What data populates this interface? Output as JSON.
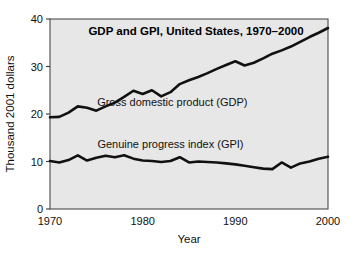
{
  "chart_data": {
    "type": "line",
    "title": "GDP and GPI, United States, 1970–2000",
    "xlabel": "Year",
    "ylabel": "Thousand 2001 dollars",
    "xlim": [
      1970,
      2000
    ],
    "ylim": [
      0,
      40
    ],
    "xticks": [
      "1970",
      "1980",
      "1990",
      "2000"
    ],
    "xtick_values": [
      1970,
      1980,
      1990,
      2000
    ],
    "yticks": [
      "0",
      "10",
      "20",
      "30",
      "40"
    ],
    "ytick_values": [
      0,
      10,
      20,
      30,
      40
    ],
    "grid": false,
    "legend_position": "inline-annotations",
    "plot_background": "#e7e7e7",
    "line_color": "#111111",
    "x": [
      1970,
      1971,
      1972,
      1973,
      1974,
      1975,
      1976,
      1977,
      1978,
      1979,
      1980,
      1981,
      1982,
      1983,
      1984,
      1985,
      1986,
      1987,
      1988,
      1989,
      1990,
      1991,
      1992,
      1993,
      1994,
      1995,
      1996,
      1997,
      1998,
      1999,
      2000
    ],
    "series": [
      {
        "name": "Gross domestic product (GDP)",
        "label": "Gross domestic product (GDP)",
        "label_x": 1983.2,
        "label_y": 21.6,
        "values": [
          19.3,
          19.4,
          20.3,
          21.6,
          21.3,
          20.7,
          21.6,
          22.4,
          23.6,
          24.9,
          24.2,
          25.0,
          23.7,
          24.6,
          26.3,
          27.1,
          27.8,
          28.6,
          29.5,
          30.3,
          31.1,
          30.2,
          30.8,
          31.7,
          32.7,
          33.4,
          34.2,
          35.2,
          36.2,
          37.1,
          38.1
        ]
      },
      {
        "name": "Genuine progress index (GPI)",
        "label": "Genuine progress index (GPI)",
        "label_x": 1983.0,
        "label_y": 12.8,
        "values": [
          10.1,
          9.8,
          10.3,
          11.3,
          10.2,
          10.8,
          11.2,
          10.9,
          11.3,
          10.6,
          10.2,
          10.1,
          9.9,
          10.1,
          10.9,
          9.8,
          10.0,
          9.9,
          9.8,
          9.6,
          9.4,
          9.1,
          8.8,
          8.5,
          8.4,
          9.8,
          8.7,
          9.6,
          10.0,
          10.6,
          11.0
        ]
      }
    ]
  }
}
